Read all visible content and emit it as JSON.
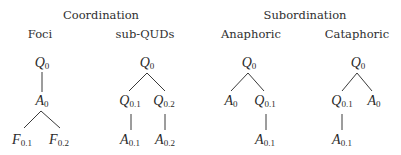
{
  "groups": [
    {
      "title": "Coordination"
    },
    {
      "title": "Subordination"
    }
  ],
  "trees": [
    {
      "label": "Foci",
      "nodes": [
        {
          "base": "Q",
          "sub": "0"
        },
        {
          "base": "A",
          "sub": "0"
        },
        {
          "base": "F",
          "sub": "0.1"
        },
        {
          "base": "F",
          "sub": "0.2"
        }
      ]
    },
    {
      "label": "sub-QUDs",
      "nodes": [
        {
          "base": "Q",
          "sub": "0"
        },
        {
          "base": "Q",
          "sub": "0.1"
        },
        {
          "base": "Q",
          "sub": "0.2"
        },
        {
          "base": "A",
          "sub": "0.1"
        },
        {
          "base": "A",
          "sub": "0.2"
        }
      ]
    },
    {
      "label": "Anaphoric",
      "nodes": [
        {
          "base": "Q",
          "sub": "0"
        },
        {
          "base": "A",
          "sub": "0"
        },
        {
          "base": "Q",
          "sub": "0.1"
        },
        {
          "base": "A",
          "sub": "0.1"
        }
      ]
    },
    {
      "label": "Cataphoric",
      "nodes": [
        {
          "base": "Q",
          "sub": "0"
        },
        {
          "base": "Q",
          "sub": "0.1"
        },
        {
          "base": "A",
          "sub": "0"
        },
        {
          "base": "A",
          "sub": "0.1"
        }
      ]
    }
  ]
}
